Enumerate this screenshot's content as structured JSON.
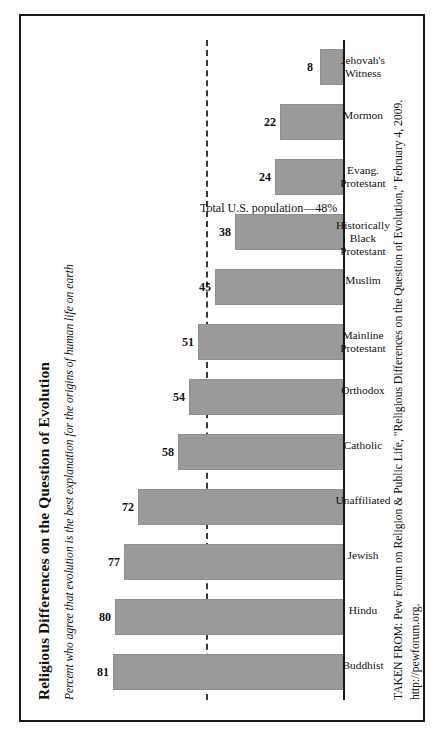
{
  "figure": {
    "title": "Religious Differences on the Question of Evolution",
    "subtitle": "Percent who agree that evolution is the best explanation for the origins of human life on earth",
    "source_line1": "TAKEN FROM: Pew Forum on Religion & Public Life, \"Religious Differences on the Question of Evolution,\" February 4, 2009.",
    "source_line2": "http://pewforum.org.",
    "bar_color": "#9a9a9a",
    "frame_color": "#1a1a1a",
    "reference_label": "Total U.S. population—48%"
  },
  "chart_data": {
    "type": "bar",
    "title": "Religious Differences on the Question of Evolution",
    "subtitle": "Percent who agree that evolution is the best explanation for the origins of human life on earth",
    "xlabel": "",
    "ylabel": "Percent",
    "ylim": [
      0,
      90
    ],
    "grid": false,
    "legend": "none",
    "orientation": "vertical",
    "categories": [
      "Buddhist",
      "Hindu",
      "Jewish",
      "Unaffiliated",
      "Catholic",
      "Orthodox",
      "Mainline\nProtestant",
      "Muslim",
      "Historically\nBlack\nProtestant",
      "Evang.\nProtestant",
      "Mormon",
      "Jehovah's\nWitness"
    ],
    "values": [
      81,
      80,
      77,
      72,
      58,
      54,
      51,
      45,
      38,
      24,
      22,
      8
    ],
    "annotations": [
      {
        "type": "reference-line",
        "label": "Total U.S. population—48%",
        "value": 48,
        "style": "dashed"
      }
    ]
  }
}
